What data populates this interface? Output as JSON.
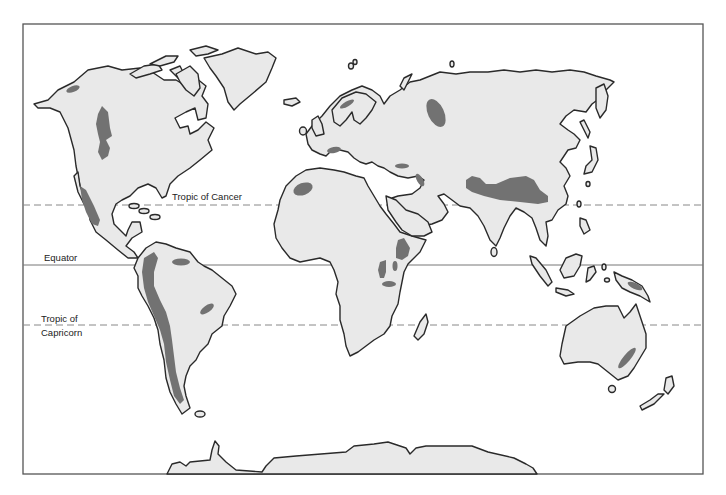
{
  "map": {
    "title": "World map showing major mountain regions",
    "colors": {
      "background": "#ffffff",
      "land": "#e9e9e9",
      "outline": "#2a2a2a",
      "highlight": "#727272",
      "reference_lines": "#888888"
    },
    "reference_lines": [
      {
        "id": "tropic-of-cancer",
        "label": "Tropic of Cancer",
        "style": "dashed"
      },
      {
        "id": "equator",
        "label": "Equator",
        "style": "solid"
      },
      {
        "id": "tropic-of-capricorn",
        "label_line1": "Tropic of",
        "label_line2": "Capricorn",
        "style": "dashed"
      }
    ],
    "labels": {
      "tropic_of_cancer": "Tropic of Cancer",
      "equator": "Equator",
      "tropic_of_capricorn_1": "Tropic of",
      "tropic_of_capricorn_2": "Capricorn"
    },
    "highlighted_regions": [
      "Alaska Range",
      "Rocky Mountains",
      "Sierra Madre",
      "Andes",
      "Guiana Highlands",
      "Brazilian Highlands",
      "Atlas Mountains",
      "Ethiopian Highlands",
      "East African Highlands",
      "Scandinavian Mountains",
      "Alps",
      "Caucasus",
      "Zagros",
      "Ural Mountains",
      "Himalaya / Tibetan Plateau",
      "New Guinea Highlands",
      "Great Dividing Range"
    ]
  }
}
